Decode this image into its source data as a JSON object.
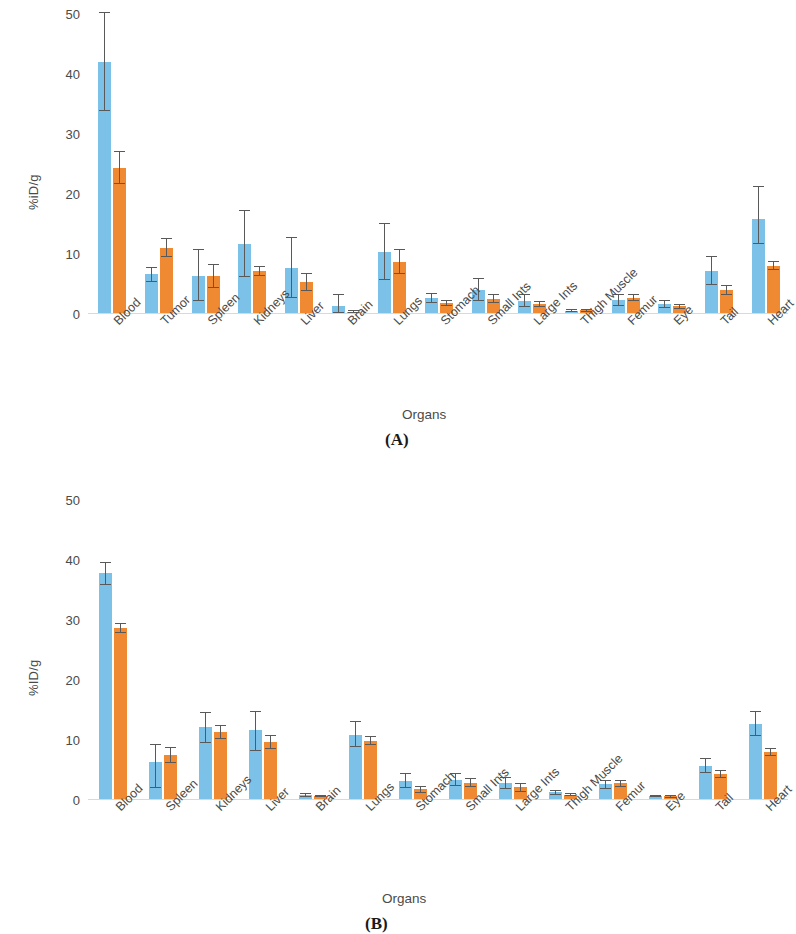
{
  "figure": {
    "panels": [
      {
        "tag": "(A)",
        "ylabel": "%iD/g",
        "xlabel": "Organs",
        "yticks": [
          "0",
          "10",
          "20",
          "30",
          "40",
          "50"
        ]
      },
      {
        "tag": "(B)",
        "ylabel": "%ID/g",
        "xlabel": "Organs",
        "yticks": [
          "0",
          "10",
          "20",
          "30",
          "40",
          "50"
        ]
      }
    ]
  },
  "colors": {
    "series1": "#7cc1e8",
    "series2": "#ef8a33",
    "error": "#595959",
    "axis": "#d9d9d9",
    "text": "#4a4a4a"
  },
  "chart_data": [
    {
      "type": "bar",
      "title": "(A)",
      "xlabel": "Organs",
      "ylabel": "%iD/g",
      "ylim": [
        0,
        50
      ],
      "yticks": [
        0,
        10,
        20,
        30,
        40,
        50
      ],
      "grid": false,
      "legend": "none",
      "categories": [
        "Blood",
        "Tumor",
        "Spleen",
        "Kidneys",
        "Liver",
        "Brain",
        "Lungs",
        "Stomach",
        "Small Ints",
        "Large Ints",
        "Thigh Muscle",
        "Femur",
        "Eye",
        "Tail",
        "Heart"
      ],
      "series": [
        {
          "name": "Series 1",
          "color": "#7cc1e8",
          "values": [
            42.0,
            6.6,
            6.4,
            11.6,
            7.7,
            1.4,
            10.3,
            2.6,
            4.0,
            2.2,
            0.5,
            2.3,
            1.6,
            7.2,
            15.9
          ],
          "errors_low": [
            8.2,
            1.2,
            4.2,
            5.4,
            5.0,
            1.2,
            4.6,
            0.8,
            1.9,
            1.0,
            0.2,
            0.9,
            0.6,
            2.3,
            4.3
          ],
          "errors_high": [
            8.3,
            1.2,
            4.5,
            5.7,
            5.1,
            1.9,
            4.8,
            0.9,
            2.0,
            1.2,
            0.3,
            1.0,
            0.7,
            2.4,
            5.5
          ]
        },
        {
          "name": "Series 2",
          "color": "#ef8a33",
          "values": [
            24.4,
            11.0,
            6.3,
            7.1,
            5.3,
            0.4,
            8.7,
            1.8,
            2.5,
            1.6,
            0.6,
            2.7,
            1.3,
            4.0,
            8.0
          ],
          "errors_low": [
            2.7,
            1.5,
            2.0,
            0.8,
            1.4,
            0.2,
            2.0,
            0.5,
            0.7,
            0.5,
            0.2,
            0.6,
            0.4,
            0.8,
            0.7
          ],
          "errors_high": [
            2.8,
            1.6,
            2.1,
            0.9,
            1.6,
            0.2,
            2.1,
            0.6,
            0.8,
            0.6,
            0.2,
            0.7,
            0.4,
            0.9,
            0.9
          ]
        }
      ]
    },
    {
      "type": "bar",
      "title": "(B)",
      "xlabel": "Organs",
      "ylabel": "%ID/g",
      "ylim": [
        0,
        50
      ],
      "yticks": [
        0,
        10,
        20,
        30,
        40,
        50
      ],
      "grid": false,
      "legend": "none",
      "categories": [
        "Blood",
        "Spleen",
        "Kidneys",
        "Liver",
        "Brain",
        "Lungs",
        "Stomach",
        "Small Ints",
        "Large Ints",
        "Thigh Muscle",
        "Femur",
        "Eye",
        "Tail",
        "Heart"
      ],
      "series": [
        {
          "name": "Series 1",
          "color": "#7cc1e8",
          "values": [
            37.8,
            6.4,
            12.2,
            11.6,
            0.8,
            10.9,
            3.2,
            3.4,
            2.8,
            1.3,
            2.6,
            0.7,
            5.7,
            12.7
          ],
          "errors_low": [
            1.9,
            4.4,
            2.7,
            3.4,
            0.3,
            2.1,
            1.2,
            1.0,
            0.9,
            0.4,
            0.7,
            0.2,
            1.2,
            2.0
          ],
          "errors_high": [
            1.9,
            3.0,
            2.5,
            3.2,
            0.3,
            2.2,
            1.3,
            1.1,
            1.0,
            0.4,
            0.8,
            0.2,
            1.3,
            2.1
          ]
        },
        {
          "name": "Series 2",
          "color": "#ef8a33",
          "values": [
            28.6,
            7.5,
            11.3,
            9.7,
            0.7,
            9.9,
            1.8,
            2.9,
            2.1,
            0.9,
            2.8,
            0.6,
            4.3,
            8.0
          ],
          "errors_low": [
            0.8,
            1.3,
            1.1,
            1.2,
            0.2,
            0.7,
            0.6,
            0.7,
            0.7,
            0.3,
            0.6,
            0.2,
            0.7,
            0.6
          ],
          "errors_high": [
            0.9,
            1.4,
            1.2,
            1.2,
            0.2,
            0.7,
            0.6,
            0.8,
            0.8,
            0.3,
            0.6,
            0.2,
            0.7,
            0.7
          ]
        }
      ]
    }
  ]
}
